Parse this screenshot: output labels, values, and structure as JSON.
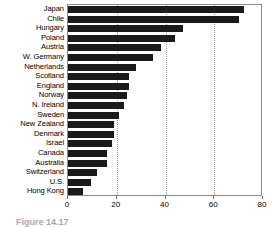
{
  "chart_data": {
    "type": "bar",
    "orientation": "horizontal",
    "title": "",
    "xlabel": "",
    "ylabel": "",
    "xlim": [
      0,
      80
    ],
    "ylim": [
      0,
      20
    ],
    "xticks": [
      0,
      20,
      40,
      60,
      80
    ],
    "xticklabels": [
      "0",
      "20",
      "40",
      "60",
      "80"
    ],
    "grid": "vertical-dotted",
    "legend": "none",
    "bar_color": "#1a1a1a",
    "categories": [
      "Japan",
      "Chile",
      "Hungary",
      "Poland",
      "Austria",
      "W. Germany",
      "Netherlands",
      "Scotland",
      "England",
      "Norway",
      "N. Ireland",
      "Sweden",
      "New Zealand",
      "Denmark",
      "Israel",
      "Canada",
      "Australia",
      "Switzerland",
      "U.S.",
      "Hong Kong"
    ],
    "values": [
      72,
      70,
      47,
      44,
      38,
      35,
      28,
      25,
      25,
      24,
      23,
      21,
      19,
      19,
      18,
      16,
      16,
      12,
      9.5,
      6
    ]
  },
  "caption": {
    "label": "Figure 14.17",
    "text": "clipped caption text"
  }
}
